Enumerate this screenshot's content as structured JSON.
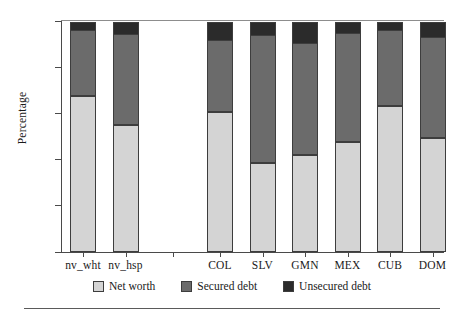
{
  "chart_data": {
    "type": "bar",
    "stacked": true,
    "title": "",
    "xlabel": "",
    "ylabel": "Percentage",
    "ylim": [
      0,
      100
    ],
    "yticks": [
      0,
      20,
      40,
      60,
      80,
      100
    ],
    "grid": false,
    "legend_position": "bottom-center",
    "categories": [
      "nv_wht",
      "nv_hsp",
      "COL",
      "SLV",
      "GMN",
      "MEX",
      "CUB",
      "DOM"
    ],
    "group_gap_after_index": 1,
    "series": [
      {
        "name": "Net worth",
        "color": "#d4d4d4",
        "values": [
          67.5,
          55.0,
          60.5,
          38.5,
          42.0,
          47.5,
          63.0,
          49.5
        ]
      },
      {
        "name": "Secured debt",
        "color": "#6b6b6b",
        "values": [
          28.5,
          39.5,
          31.5,
          55.5,
          48.5,
          47.5,
          33.0,
          43.5
        ]
      },
      {
        "name": "Unsecured debt",
        "color": "#2b2b2b",
        "values": [
          4.0,
          5.5,
          8.0,
          6.0,
          9.5,
          5.0,
          4.0,
          7.0
        ]
      }
    ]
  },
  "axes": {
    "y_label": "Percentage",
    "y_tick_labels": [
      "0",
      "20",
      "40",
      "60",
      "80",
      "100"
    ]
  },
  "legend": {
    "items": [
      {
        "label": "Net worth",
        "color": "#d4d4d4"
      },
      {
        "label": "Secured debt",
        "color": "#6b6b6b"
      },
      {
        "label": "Unsecured debt",
        "color": "#2b2b2b"
      }
    ]
  }
}
